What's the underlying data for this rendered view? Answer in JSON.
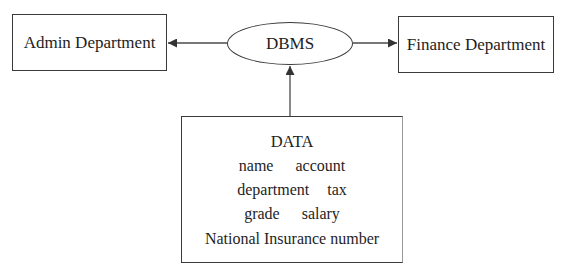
{
  "diagram": {
    "top_partial_text": "...pp...",
    "nodes": {
      "admin": {
        "label": "Admin Department",
        "shape": "rectangle"
      },
      "dbms": {
        "label": "DBMS",
        "shape": "ellipse"
      },
      "finance": {
        "label": "Finance Department",
        "shape": "rectangle"
      },
      "data": {
        "shape": "rectangle",
        "title": "DATA",
        "rows": [
          [
            "name",
            "account"
          ],
          [
            "department",
            "tax"
          ],
          [
            "grade",
            "salary"
          ],
          [
            "National Insurance number"
          ]
        ]
      }
    },
    "edges": [
      {
        "from": "DBMS",
        "to": "Admin Department",
        "arrow": "arrow-left"
      },
      {
        "from": "DBMS",
        "to": "Finance Department",
        "arrow": "arrow-right"
      },
      {
        "from": "DATA",
        "to": "DBMS",
        "arrow": "arrow-up"
      }
    ],
    "colors": {
      "line": "#3a3a3a",
      "text": "#1e1e1e",
      "background": "#ffffff"
    }
  }
}
